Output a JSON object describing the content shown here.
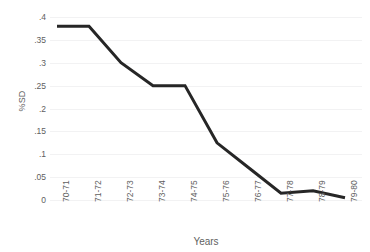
{
  "chart_data": {
    "type": "line",
    "title": "",
    "xlabel": "Years",
    "ylabel": "%SD",
    "categories": [
      "70-71",
      "71-72",
      "72-73",
      "73-74",
      "74-75",
      "75-76",
      "76-77",
      "77-78",
      "78-79",
      "79-80"
    ],
    "values": [
      0.38,
      0.38,
      0.3,
      0.25,
      0.25,
      0.125,
      0.07,
      0.015,
      0.02,
      0.005
    ],
    "series": [
      {
        "name": "%SD",
        "values": [
          0.38,
          0.38,
          0.3,
          0.25,
          0.25,
          0.125,
          0.07,
          0.015,
          0.02,
          0.005
        ]
      }
    ],
    "ylim": [
      0,
      0.4
    ],
    "yticks": [
      0.4,
      0.35,
      0.3,
      0.25,
      0.2,
      0.15,
      0.1,
      0.05,
      0
    ],
    "ytick_labels": [
      ".4",
      ".35",
      ".3",
      ".25",
      ".2",
      ".15",
      ".1",
      ".05",
      "0"
    ],
    "grid": true,
    "grid_axis": "y",
    "legend": false,
    "legend_position": "none",
    "line_color": "#262626",
    "grid_color": "#f2f2f3",
    "background_color": "#ffffff",
    "markers": false
  }
}
